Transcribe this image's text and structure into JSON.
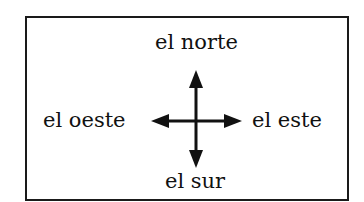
{
  "diagram": {
    "labels": {
      "north": "el norte",
      "south": "el sur",
      "east": "el este",
      "west": "el oeste"
    },
    "colors": {
      "ink": "#111111",
      "border": "#1a1a1a",
      "background": "#ffffff"
    },
    "icons": {
      "compass": "four-way-arrow-icon"
    }
  }
}
